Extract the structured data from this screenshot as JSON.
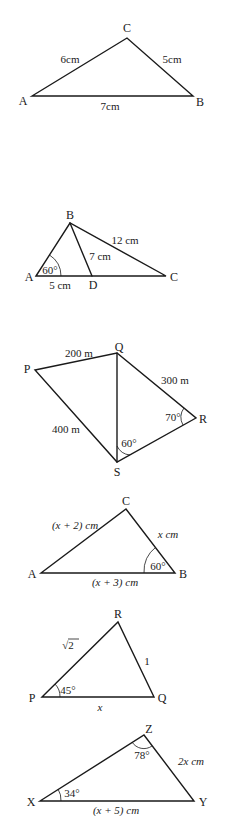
{
  "figures": [
    {
      "id": "fig1",
      "vertices": {
        "A": "A",
        "B": "B",
        "C": "C"
      },
      "sides": {
        "AC": "6cm",
        "CB": "5cm",
        "AB": "7cm"
      }
    },
    {
      "id": "fig2",
      "vertices": {
        "A": "A",
        "B": "B",
        "C": "C",
        "D": "D"
      },
      "sides": {
        "BC": "12 cm",
        "BD": "7 cm",
        "AD": "5 cm"
      },
      "angles": {
        "A": "60°"
      }
    },
    {
      "id": "fig3",
      "vertices": {
        "P": "P",
        "Q": "Q",
        "R": "R",
        "S": "S"
      },
      "sides": {
        "PQ": "200 m",
        "QR": "300 m",
        "PS": "400 m"
      },
      "angles": {
        "R": "70°",
        "S": "60°"
      }
    },
    {
      "id": "fig4",
      "vertices": {
        "A": "A",
        "B": "B",
        "C": "C"
      },
      "sides": {
        "AC": "(x + 2) cm",
        "CB": "x cm",
        "AB": "(x + 3) cm"
      },
      "angles": {
        "B": "60°"
      }
    },
    {
      "id": "fig5",
      "vertices": {
        "P": "P",
        "Q": "Q",
        "R": "R"
      },
      "sides": {
        "PR": "√2",
        "RQ": "1",
        "PQ": "x"
      },
      "angles": {
        "P": "45°"
      }
    },
    {
      "id": "fig6",
      "vertices": {
        "X": "X",
        "Y": "Y",
        "Z": "Z"
      },
      "sides": {
        "ZY": "2x cm",
        "XY": "(x + 5) cm"
      },
      "angles": {
        "Z": "78°",
        "X": "34°"
      }
    }
  ]
}
